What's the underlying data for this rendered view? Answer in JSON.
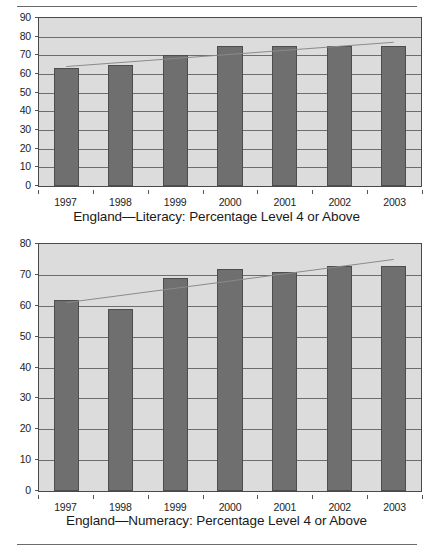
{
  "document": {
    "rules": [
      "top-rule",
      "bottom-rule"
    ]
  },
  "chart_data": [
    {
      "id": "literacy",
      "type": "bar",
      "title": "England—Literacy: Percentage Level 4 or Above",
      "xlabel": "",
      "ylabel": "",
      "categories": [
        "1997",
        "1998",
        "1999",
        "2000",
        "2001",
        "2002",
        "2003"
      ],
      "values": [
        63,
        65,
        70,
        75,
        75,
        75,
        75
      ],
      "ylim": [
        0,
        90
      ],
      "ytick_step": 10,
      "yticks": [
        "0",
        "10",
        "20",
        "30",
        "40",
        "50",
        "60",
        "70",
        "80",
        "90"
      ],
      "grid": true,
      "legend": "none",
      "series": [
        {
          "name": "Percentage Level 4 or Above",
          "values": [
            63,
            65,
            70,
            75,
            75,
            75,
            75
          ],
          "color": "#6f6f6f"
        },
        {
          "name": "Linear trend",
          "type": "line",
          "endpoints": [
            64,
            77
          ],
          "color": "#8a8a8a"
        }
      ]
    },
    {
      "id": "numeracy",
      "type": "bar",
      "title": "England—Numeracy: Percentage Level 4 or Above",
      "xlabel": "",
      "ylabel": "",
      "categories": [
        "1997",
        "1998",
        "1999",
        "2000",
        "2001",
        "2002",
        "2003"
      ],
      "values": [
        62,
        59,
        69,
        72,
        71,
        73,
        73
      ],
      "ylim": [
        0,
        80
      ],
      "ytick_step": 10,
      "yticks": [
        "0",
        "10",
        "20",
        "30",
        "40",
        "50",
        "60",
        "70",
        "80"
      ],
      "grid": true,
      "legend": "none",
      "series": [
        {
          "name": "Percentage Level 4 or Above",
          "values": [
            62,
            59,
            69,
            72,
            71,
            73,
            73
          ],
          "color": "#6f6f6f"
        },
        {
          "name": "Linear trend",
          "type": "line",
          "endpoints": [
            61,
            75
          ],
          "color": "#8a8a8a"
        }
      ]
    }
  ],
  "colors": {
    "bar": "#6f6f6f",
    "bar_border": "#4d4d4d",
    "plot_background": "#dcdcdc",
    "gridline": "#6d6d6d",
    "trendline": "#8a8a8a",
    "text": "#1a1a1a",
    "rule": "#6a6a6a",
    "page_background": "#ffffff"
  }
}
